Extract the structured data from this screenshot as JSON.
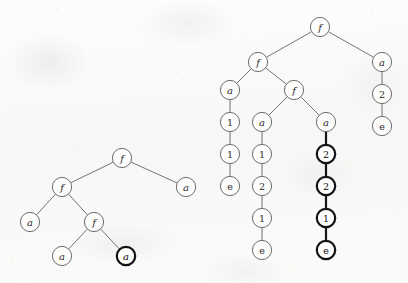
{
  "figure": {
    "caption": "",
    "width": 408,
    "height": 283,
    "background_color": "#fbfbfa",
    "thin_stroke_color": "#5c5c61",
    "bold_stroke_color": "#121216",
    "node_fill_color": "#fdfdfc",
    "node_radius": 10,
    "bold_node_radius": 10
  },
  "trees": [
    {
      "id": "left-tree",
      "name": "left-term-tree",
      "nodes": [
        {
          "id": "L0",
          "label": "f",
          "style": "italic",
          "emphasis": "thin",
          "x": 122,
          "y": 158
        },
        {
          "id": "L1",
          "label": "f",
          "style": "italic",
          "emphasis": "thin",
          "x": 62,
          "y": 187
        },
        {
          "id": "L2",
          "label": "a",
          "style": "italic",
          "emphasis": "thin",
          "x": 186,
          "y": 187
        },
        {
          "id": "L3",
          "label": "a",
          "style": "italic",
          "emphasis": "thin",
          "x": 30,
          "y": 222
        },
        {
          "id": "L4",
          "label": "f",
          "style": "italic",
          "emphasis": "thin",
          "x": 94,
          "y": 222
        },
        {
          "id": "L5",
          "label": "a",
          "style": "italic",
          "emphasis": "thin",
          "x": 62,
          "y": 256
        },
        {
          "id": "L6",
          "label": "a",
          "style": "italic",
          "emphasis": "bold",
          "x": 126,
          "y": 256
        }
      ],
      "edges": [
        {
          "from": "L0",
          "to": "L1",
          "emphasis": "thin"
        },
        {
          "from": "L0",
          "to": "L2",
          "emphasis": "thin"
        },
        {
          "from": "L1",
          "to": "L3",
          "emphasis": "thin"
        },
        {
          "from": "L1",
          "to": "L4",
          "emphasis": "thin"
        },
        {
          "from": "L4",
          "to": "L5",
          "emphasis": "thin"
        },
        {
          "from": "L4",
          "to": "L6",
          "emphasis": "thin"
        }
      ]
    },
    {
      "id": "right-tree",
      "name": "right-term-tree",
      "nodes": [
        {
          "id": "R0",
          "label": "f",
          "style": "italic",
          "emphasis": "thin",
          "x": 320,
          "y": 27
        },
        {
          "id": "R1",
          "label": "f",
          "style": "italic",
          "emphasis": "thin",
          "x": 258,
          "y": 62
        },
        {
          "id": "R2",
          "label": "a",
          "style": "italic",
          "emphasis": "thin",
          "x": 382,
          "y": 62
        },
        {
          "id": "R3",
          "label": "2",
          "style": "upright",
          "emphasis": "thin",
          "x": 382,
          "y": 94
        },
        {
          "id": "R4",
          "label": "e",
          "style": "upright",
          "emphasis": "thin",
          "x": 382,
          "y": 126
        },
        {
          "id": "R5",
          "label": "a",
          "style": "italic",
          "emphasis": "thin",
          "x": 230,
          "y": 90
        },
        {
          "id": "R6",
          "label": "f",
          "style": "italic",
          "emphasis": "thin",
          "x": 294,
          "y": 90
        },
        {
          "id": "R7",
          "label": "1",
          "style": "upright",
          "emphasis": "thin",
          "x": 230,
          "y": 122
        },
        {
          "id": "R8",
          "label": "1",
          "style": "upright",
          "emphasis": "thin",
          "x": 230,
          "y": 154
        },
        {
          "id": "R9",
          "label": "e",
          "style": "upright",
          "emphasis": "thin",
          "x": 230,
          "y": 186
        },
        {
          "id": "R10",
          "label": "a",
          "style": "italic",
          "emphasis": "thin",
          "x": 262,
          "y": 122
        },
        {
          "id": "R11",
          "label": "1",
          "style": "upright",
          "emphasis": "thin",
          "x": 262,
          "y": 154
        },
        {
          "id": "R12",
          "label": "2",
          "style": "upright",
          "emphasis": "thin",
          "x": 262,
          "y": 186
        },
        {
          "id": "R13",
          "label": "1",
          "style": "upright",
          "emphasis": "thin",
          "x": 262,
          "y": 218
        },
        {
          "id": "R14",
          "label": "e",
          "style": "upright",
          "emphasis": "thin",
          "x": 262,
          "y": 250
        },
        {
          "id": "R15",
          "label": "a",
          "style": "italic",
          "emphasis": "thin",
          "x": 326,
          "y": 122
        },
        {
          "id": "R16",
          "label": "2",
          "style": "upright",
          "emphasis": "bold",
          "x": 326,
          "y": 154
        },
        {
          "id": "R17",
          "label": "2",
          "style": "upright",
          "emphasis": "bold",
          "x": 326,
          "y": 186
        },
        {
          "id": "R18",
          "label": "1",
          "style": "upright",
          "emphasis": "bold",
          "x": 326,
          "y": 218
        },
        {
          "id": "R19",
          "label": "e",
          "style": "upright",
          "emphasis": "bold",
          "x": 326,
          "y": 250
        }
      ],
      "edges": [
        {
          "from": "R0",
          "to": "R1",
          "emphasis": "thin"
        },
        {
          "from": "R0",
          "to": "R2",
          "emphasis": "thin"
        },
        {
          "from": "R2",
          "to": "R3",
          "emphasis": "thin"
        },
        {
          "from": "R3",
          "to": "R4",
          "emphasis": "thin"
        },
        {
          "from": "R1",
          "to": "R5",
          "emphasis": "thin"
        },
        {
          "from": "R1",
          "to": "R6",
          "emphasis": "thin"
        },
        {
          "from": "R5",
          "to": "R7",
          "emphasis": "thin"
        },
        {
          "from": "R7",
          "to": "R8",
          "emphasis": "thin"
        },
        {
          "from": "R8",
          "to": "R9",
          "emphasis": "thin"
        },
        {
          "from": "R6",
          "to": "R10",
          "emphasis": "thin"
        },
        {
          "from": "R10",
          "to": "R11",
          "emphasis": "thin"
        },
        {
          "from": "R11",
          "to": "R12",
          "emphasis": "thin"
        },
        {
          "from": "R12",
          "to": "R13",
          "emphasis": "thin"
        },
        {
          "from": "R13",
          "to": "R14",
          "emphasis": "thin"
        },
        {
          "from": "R6",
          "to": "R15",
          "emphasis": "thin"
        },
        {
          "from": "R15",
          "to": "R16",
          "emphasis": "bold"
        },
        {
          "from": "R16",
          "to": "R17",
          "emphasis": "bold"
        },
        {
          "from": "R17",
          "to": "R18",
          "emphasis": "bold"
        },
        {
          "from": "R18",
          "to": "R19",
          "emphasis": "bold"
        }
      ]
    }
  ],
  "specks": [
    {
      "x": 8,
      "y": 14,
      "r": 1.2
    },
    {
      "x": 57,
      "y": 9,
      "r": 0.9
    },
    {
      "x": 141,
      "y": 31,
      "r": 1.1
    },
    {
      "x": 205,
      "y": 18,
      "r": 0.8
    },
    {
      "x": 372,
      "y": 12,
      "r": 1.0
    },
    {
      "x": 21,
      "y": 84,
      "r": 1.0
    },
    {
      "x": 96,
      "y": 112,
      "r": 0.9
    },
    {
      "x": 177,
      "y": 73,
      "r": 1.2
    },
    {
      "x": 350,
      "y": 165,
      "r": 1.0
    },
    {
      "x": 399,
      "y": 208,
      "r": 0.9
    },
    {
      "x": 12,
      "y": 263,
      "r": 1.1
    },
    {
      "x": 163,
      "y": 274,
      "r": 0.9
    },
    {
      "x": 290,
      "y": 268,
      "r": 1.0
    },
    {
      "x": 243,
      "y": 40,
      "r": 0.8
    },
    {
      "x": 76,
      "y": 151,
      "r": 0.9
    }
  ]
}
